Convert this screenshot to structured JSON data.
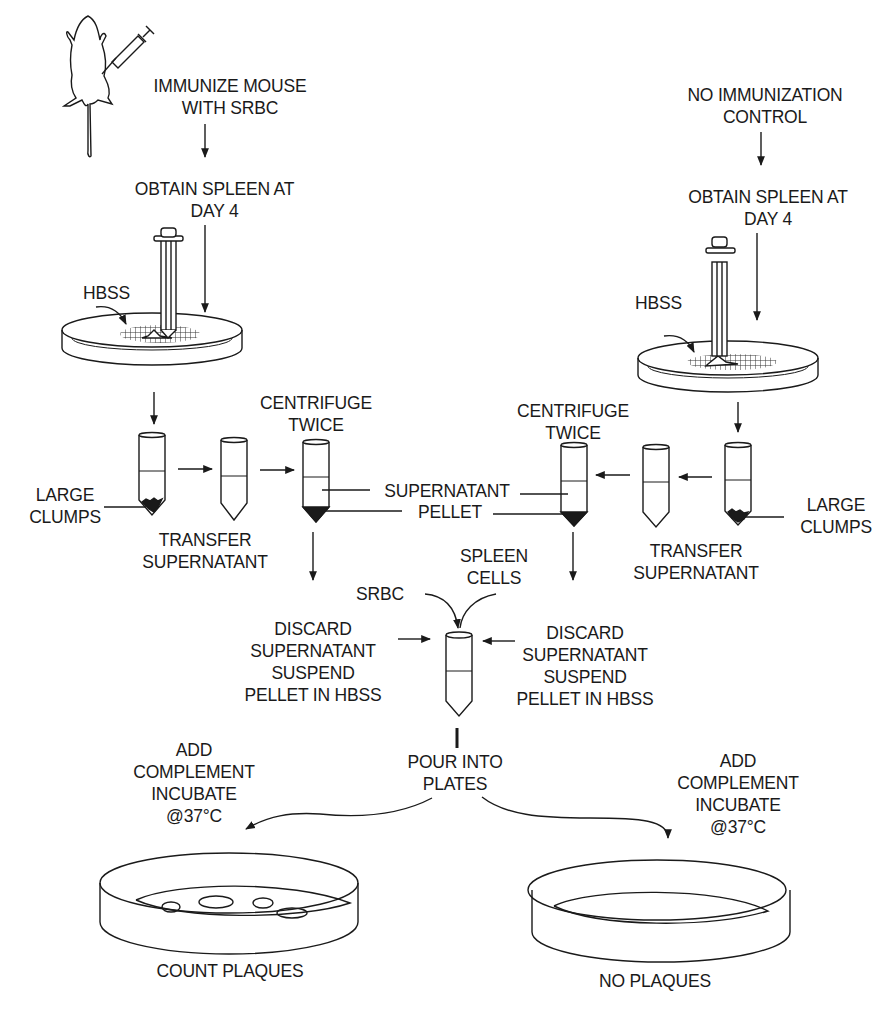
{
  "diagram": {
    "left_branch": {
      "start": "IMMUNIZE MOUSE\nWITH SRBC",
      "obtain": "OBTAIN SPLEEN AT\nDAY 4",
      "hbss": "HBSS",
      "large_clumps": "LARGE\nCLUMPS",
      "transfer": "TRANSFER\nSUPERNATANT",
      "centrifuge": "CENTRIFUGE\nTWICE",
      "discard": "DISCARD\nSUPERNATANT\nSUSPEND\nPELLET IN HBSS",
      "incubate": "ADD\nCOMPLEMENT\nINCUBATE\n@37°C",
      "result": "COUNT PLAQUES"
    },
    "right_branch": {
      "start": "NO IMMUNIZATION\nCONTROL",
      "obtain": "OBTAIN SPLEEN AT\nDAY 4",
      "hbss": "HBSS",
      "large_clumps": "LARGE\nCLUMPS",
      "transfer": "TRANSFER\nSUPERNATANT",
      "centrifuge": "CENTRIFUGE\nTWICE",
      "discard": "DISCARD\nSUPERNATANT\nSUSPEND\nPELLET IN HBSS",
      "incubate": "ADD\nCOMPLEMENT\nINCUBATE\n@37°C",
      "result": "NO PLAQUES"
    },
    "shared": {
      "supernatant": "SUPERNATANT",
      "pellet": "PELLET",
      "srbc": "SRBC",
      "spleen_cells": "SPLEEN\nCELLS",
      "pour": "POUR INTO\nPLATES"
    },
    "colors": {
      "ink": "#1a1a1a",
      "background": "#ffffff"
    }
  }
}
